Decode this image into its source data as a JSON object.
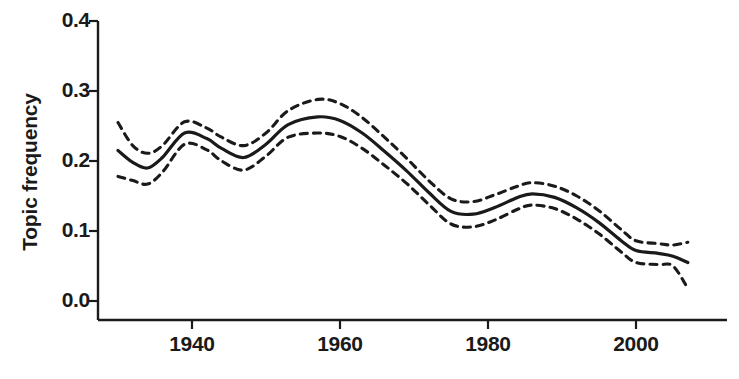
{
  "chart_data": {
    "type": "line",
    "title": "",
    "xlabel": "",
    "ylabel": "Topic frequency",
    "xlim": [
      1930,
      2008
    ],
    "ylim": [
      0.0,
      0.4
    ],
    "grid": false,
    "legend": "none",
    "xticks": [
      1940,
      1960,
      1980,
      2000
    ],
    "xtick_labels": [
      "1940",
      "1960",
      "1980",
      "2000"
    ],
    "yticks": [
      0.0,
      0.1,
      0.2,
      0.3,
      0.4
    ],
    "ytick_labels": [
      "0.0",
      "0.1",
      "0.2",
      "0.3",
      "0.4"
    ],
    "series": [
      {
        "name": "Topic frequency (fitted)",
        "style": "solid",
        "color": "#1a1a1a",
        "x": [
          1930,
          1932,
          1934,
          1936,
          1939,
          1942,
          1944,
          1947,
          1950,
          1953,
          1957,
          1960,
          1963,
          1966,
          1969,
          1972,
          1975,
          1978,
          1981,
          1984,
          1986,
          1989,
          1992,
          1995,
          1998,
          2000,
          2003,
          2005,
          2007
        ],
        "values": [
          0.215,
          0.198,
          0.19,
          0.205,
          0.24,
          0.232,
          0.218,
          0.205,
          0.224,
          0.252,
          0.263,
          0.258,
          0.24,
          0.214,
          0.186,
          0.155,
          0.128,
          0.124,
          0.134,
          0.148,
          0.153,
          0.148,
          0.133,
          0.112,
          0.086,
          0.072,
          0.068,
          0.064,
          0.055
        ]
      },
      {
        "name": "Upper confidence bound",
        "style": "dashed",
        "color": "#1a1a1a",
        "x": [
          1930,
          1932,
          1934,
          1936,
          1939,
          1942,
          1944,
          1947,
          1950,
          1953,
          1957,
          1960,
          1963,
          1966,
          1969,
          1972,
          1975,
          1978,
          1981,
          1984,
          1986,
          1989,
          1992,
          1995,
          1998,
          2000,
          2003,
          2005,
          2007
        ],
        "values": [
          0.255,
          0.222,
          0.211,
          0.222,
          0.256,
          0.247,
          0.234,
          0.222,
          0.24,
          0.272,
          0.288,
          0.282,
          0.262,
          0.234,
          0.204,
          0.172,
          0.146,
          0.142,
          0.152,
          0.164,
          0.169,
          0.164,
          0.15,
          0.129,
          0.102,
          0.086,
          0.082,
          0.08,
          0.084
        ]
      },
      {
        "name": "Lower confidence bound",
        "style": "dashed",
        "color": "#1a1a1a",
        "x": [
          1930,
          1932,
          1934,
          1936,
          1939,
          1942,
          1944,
          1947,
          1950,
          1953,
          1957,
          1960,
          1963,
          1966,
          1969,
          1972,
          1975,
          1978,
          1981,
          1984,
          1986,
          1989,
          1992,
          1995,
          1998,
          2000,
          2003,
          2005,
          2007
        ],
        "values": [
          0.178,
          0.172,
          0.167,
          0.184,
          0.224,
          0.216,
          0.2,
          0.187,
          0.207,
          0.234,
          0.24,
          0.235,
          0.218,
          0.194,
          0.168,
          0.138,
          0.11,
          0.106,
          0.116,
          0.131,
          0.137,
          0.132,
          0.117,
          0.096,
          0.07,
          0.055,
          0.052,
          0.05,
          0.018
        ]
      }
    ],
    "annotations": []
  },
  "axes": {
    "y_title": "Topic frequency",
    "y_labels": [
      "0.4",
      "0.3",
      "0.2",
      "0.1",
      "0.0"
    ],
    "x_labels": [
      "1940",
      "1960",
      "1980",
      "2000"
    ]
  }
}
